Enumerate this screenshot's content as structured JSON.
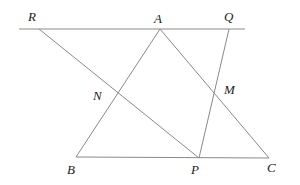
{
  "diagram": {
    "type": "geometry",
    "stroke_color": "#8a8a8a",
    "points": {
      "R": {
        "label": "R",
        "x": 39,
        "y": 29,
        "lx": 28,
        "ly": 10
      },
      "A": {
        "label": "A",
        "x": 160,
        "y": 29,
        "lx": 154,
        "ly": 12
      },
      "Q": {
        "label": "Q",
        "x": 229,
        "y": 29,
        "lx": 224,
        "ly": 10
      },
      "N": {
        "label": "N",
        "x": 117,
        "y": 93,
        "lx": 93,
        "ly": 89
      },
      "M": {
        "label": "M",
        "x": 215,
        "y": 92,
        "lx": 224,
        "ly": 83
      },
      "B": {
        "label": "B",
        "x": 76,
        "y": 157,
        "lx": 67,
        "ly": 163
      },
      "P": {
        "label": "P",
        "x": 199,
        "y": 158,
        "lx": 191,
        "ly": 163
      },
      "C": {
        "label": "C",
        "x": 269,
        "y": 158,
        "lx": 267,
        "ly": 161
      }
    },
    "segments": [
      {
        "name": "line-RQ",
        "x1": 19,
        "y1": 29,
        "x2": 245,
        "y2": 29
      },
      {
        "name": "segment-AB",
        "x1": 160,
        "y1": 29,
        "x2": 76,
        "y2": 157
      },
      {
        "name": "segment-AC",
        "x1": 160,
        "y1": 29,
        "x2": 269,
        "y2": 158
      },
      {
        "name": "segment-BC",
        "x1": 76,
        "y1": 157,
        "x2": 269,
        "y2": 158
      },
      {
        "name": "segment-RP",
        "x1": 39,
        "y1": 29,
        "x2": 199,
        "y2": 158
      },
      {
        "name": "segment-QP",
        "x1": 229,
        "y1": 29,
        "x2": 199,
        "y2": 158
      }
    ]
  }
}
